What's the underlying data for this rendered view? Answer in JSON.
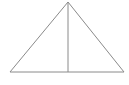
{
  "figure": {
    "name": "isosceles-triangle-with-altitude",
    "kind": "geometry-diagram",
    "canvas": {
      "width": 129,
      "height": 85,
      "background_color": "#ffffff"
    },
    "style": {
      "stroke_color": "#8a8a8a",
      "stroke_width": 1,
      "fill_color": "none"
    },
    "points": {
      "apex": {
        "label": "",
        "x": 68,
        "y": 2
      },
      "base_left": {
        "label": "",
        "x": 10,
        "y": 72
      },
      "base_right": {
        "label": "",
        "x": 124,
        "y": 72
      },
      "base_midpoint": {
        "label": "",
        "x": 68,
        "y": 72
      }
    },
    "segments": [
      {
        "name": "left-side",
        "from": "base_left",
        "to": "apex",
        "x1": 10,
        "y1": 72,
        "x2": 68,
        "y2": 2
      },
      {
        "name": "right-side",
        "from": "apex",
        "to": "base_right",
        "x1": 68,
        "y1": 2,
        "x2": 124,
        "y2": 72
      },
      {
        "name": "base",
        "from": "base_right",
        "to": "base_left",
        "x1": 124,
        "y1": 72,
        "x2": 10,
        "y2": 72
      },
      {
        "name": "altitude",
        "from": "apex",
        "to": "base_midpoint",
        "x1": 68,
        "y1": 2,
        "x2": 68,
        "y2": 72
      }
    ],
    "outline_path": "M 10 72 L 68 2 L 124 72 Z",
    "altitude_path": "M 68 2 L 68 72",
    "labels": []
  }
}
